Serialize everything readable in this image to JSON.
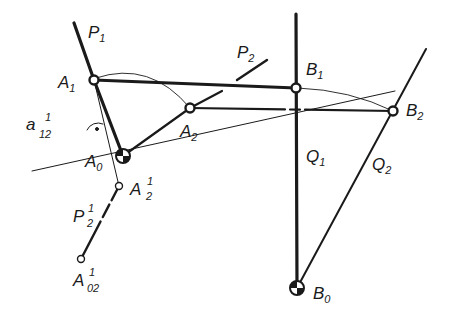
{
  "diagram": {
    "type": "four-bar linkage synthesis drawing",
    "colors": {
      "ink": "#1a1a1a",
      "thin": "#333333",
      "background": "#ffffff"
    },
    "labels": {
      "P1": {
        "base": "P",
        "sub": "1"
      },
      "P2": {
        "base": "P",
        "sub": "2"
      },
      "A1": {
        "base": "A",
        "sub": "1"
      },
      "A2": {
        "base": "A",
        "sub": "2"
      },
      "A0": {
        "base": "A",
        "sub": "0"
      },
      "B1": {
        "base": "B",
        "sub": "1"
      },
      "B2": {
        "base": "B",
        "sub": "2"
      },
      "B0": {
        "base": "B",
        "sub": "0"
      },
      "Q1": {
        "base": "Q",
        "sub": "1"
      },
      "Q2": {
        "base": "Q",
        "sub": "2"
      },
      "a12": {
        "base": "a",
        "sub": "12",
        "sup": "1"
      },
      "A2p": {
        "base": "A",
        "sub": "2",
        "sup": "1"
      },
      "P2p": {
        "base": "P",
        "sub": "2",
        "sup": "1"
      },
      "A02p": {
        "base": "A",
        "sub": "02",
        "sup": "1"
      }
    },
    "points": {
      "A1": [
        94,
        80
      ],
      "A2": [
        190,
        108
      ],
      "A0": [
        123,
        156
      ],
      "B1": [
        296,
        88
      ],
      "B2": [
        393,
        111
      ],
      "B0": [
        297,
        288
      ],
      "A2p": [
        119,
        186
      ],
      "A02p": [
        81,
        259
      ]
    },
    "annotations": {
      "right_angle_marker": "dot",
      "fixed_pivot_symbol": "quartered-circle"
    }
  }
}
